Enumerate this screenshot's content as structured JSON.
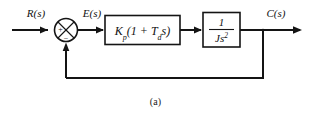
{
  "figure": {
    "caption": "(a)",
    "type": "control-system-block-diagram",
    "line_color": "#141414",
    "background_color": "#ffffff"
  },
  "signals": {
    "input_label": "R(s)",
    "error_label": "E(s)",
    "output_label": "C(s)"
  },
  "summing_junction": {
    "name": "summing-junction",
    "shape": "circle-with-cross",
    "input_sign": "+",
    "feedback_sign": "−"
  },
  "blocks": [
    {
      "id": "controller",
      "name": "controller-block",
      "kind": "expression",
      "text": "Kp(1 + Tds)",
      "parts": {
        "gain": "K",
        "gain_sub": "p",
        "open_paren": "(1 + ",
        "time_const": "T",
        "time_sub": "d",
        "var": "s",
        "close_paren": ")"
      }
    },
    {
      "id": "plant",
      "name": "plant-block",
      "kind": "fraction",
      "numerator": "1",
      "denominator": "Js",
      "denominator_exponent": "2"
    }
  ],
  "feedback": {
    "name": "feedback-path",
    "description": "unity feedback from output to summing junction"
  }
}
